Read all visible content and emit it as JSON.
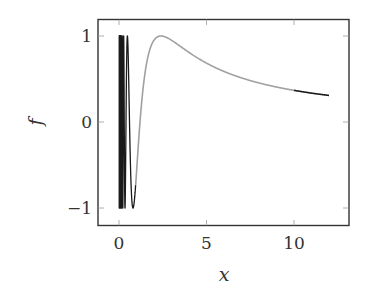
{
  "chart_data": {
    "type": "line",
    "title": "",
    "xlabel": "x",
    "ylabel": "f",
    "xlim": [
      -1.2,
      13.2
    ],
    "ylim": [
      -1.2,
      1.2
    ],
    "xticks": [
      0,
      5,
      10
    ],
    "xtick_labels": [
      "0",
      "5",
      "10"
    ],
    "yticks": [
      -1,
      0,
      1
    ],
    "ytick_labels": [
      "−1",
      "0",
      "1"
    ],
    "grid": false,
    "legend": null,
    "function": "f(x) = sin(3.77 / x)",
    "series": [
      {
        "name": "highlighted (black), x < 0.95",
        "color": "#1a1a1a",
        "x_range": [
          0.01,
          0.95
        ],
        "description": "rapid oscillation between -1 and 1 near x = 0"
      },
      {
        "name": "middle (gray), 0.95 <= x <= 10",
        "color": "#a0a0a0",
        "x_range": [
          0.95,
          10
        ],
        "x": [
          0.95,
          1.2,
          1.5,
          2.0,
          2.4,
          3.0,
          4.0,
          5.0,
          6.0,
          7.0,
          8.0,
          9.0,
          10.0
        ],
        "values": [
          -0.97,
          -0.01,
          0.59,
          0.95,
          1.0,
          0.95,
          0.81,
          0.68,
          0.59,
          0.51,
          0.45,
          0.41,
          0.37
        ]
      },
      {
        "name": "tail (black), x > 10",
        "color": "#1a1a1a",
        "x_range": [
          10,
          12
        ],
        "x": [
          10,
          11,
          12
        ],
        "values": [
          0.37,
          0.34,
          0.31
        ]
      }
    ]
  }
}
